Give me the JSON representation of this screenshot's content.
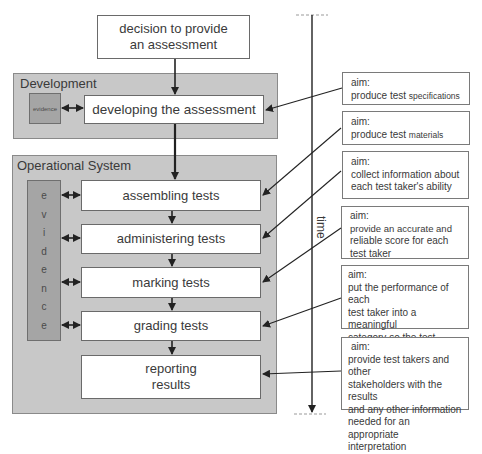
{
  "diagram": {
    "start": {
      "line1": "decision to provide",
      "line2": "an assessment"
    },
    "development": {
      "label": "Development",
      "evidence": "evidence",
      "stage": "developing the assessment"
    },
    "operational": {
      "label": "Operational System",
      "evidence_letters": [
        "e",
        "v",
        "i",
        "d",
        "e",
        "n",
        "c",
        "e"
      ],
      "stages": [
        {
          "label": "assembling tests"
        },
        {
          "label": "administering tests"
        },
        {
          "label": "marking tests"
        },
        {
          "label": "grading tests"
        },
        {
          "line1": "reporting",
          "line2": "results"
        }
      ]
    },
    "time_axis": {
      "label": "time"
    },
    "aims": [
      {
        "heading": "aim:",
        "text_a": "produce test ",
        "text_b": "specifications"
      },
      {
        "heading": "aim:",
        "text_a": "produce test ",
        "text_b": "materials"
      },
      {
        "heading": "aim:",
        "lines": [
          "collect information about",
          "each test taker's ability"
        ]
      },
      {
        "heading": "aim:",
        "lines": [
          "provide an accurate and",
          "reliable score for each",
          "test taker"
        ]
      },
      {
        "heading": "aim:",
        "lines": [
          "put the performance of each",
          "test taker into a meaningful",
          "category so the test result",
          "can be understood"
        ]
      },
      {
        "heading": "aim:",
        "lines": [
          "provide test takers and other",
          "stakeholders with the results",
          "and any other information",
          "needed for an appropriate",
          "interpretation"
        ]
      }
    ],
    "colors": {
      "panel": "#c8c8c8",
      "evidence": "#a5a5a5",
      "box": "#ffffff",
      "stroke": "#222222"
    }
  }
}
